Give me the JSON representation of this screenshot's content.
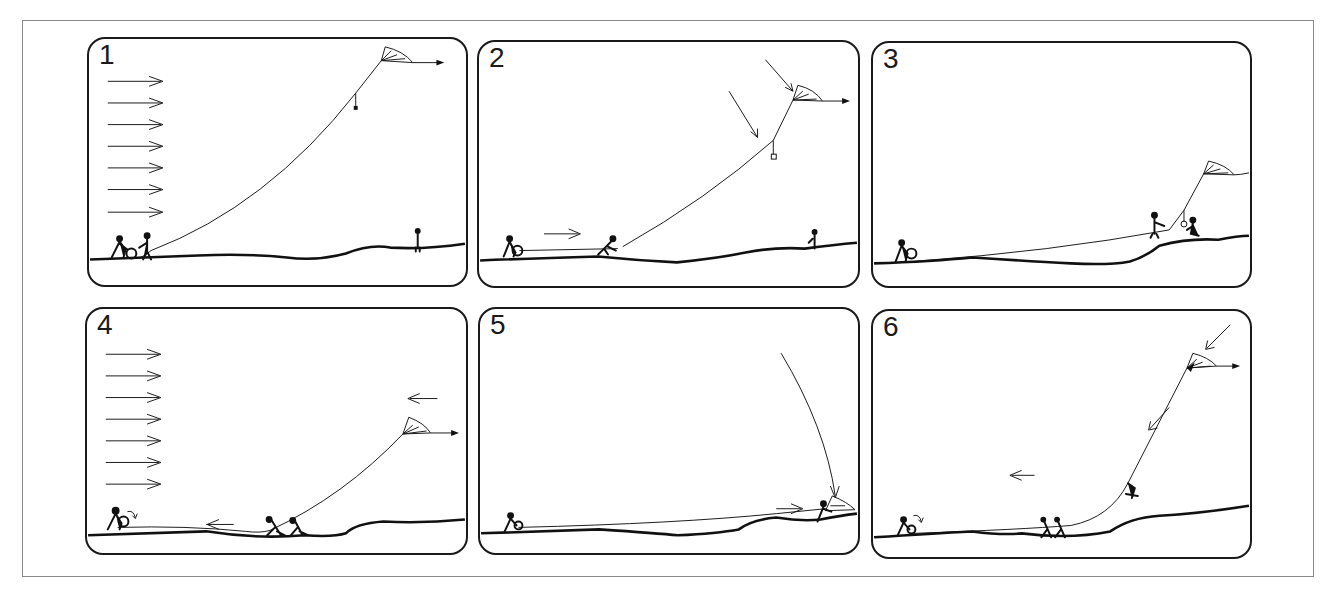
{
  "figure": {
    "type": "sequence-diagram",
    "panel_count": 6,
    "colors": {
      "ink": "#1a1a1a",
      "frame": "#8a8a8a",
      "background": "#ffffff"
    }
  },
  "panels": [
    {
      "number": "1",
      "wind_arrows": 7,
      "description": "Kite flying high; line held by two people at left; person standing on rise at right"
    },
    {
      "number": "2",
      "wind_arrows": 0,
      "description": "Kite being pulled down; arrows pointing at kite; person moving line toward right"
    },
    {
      "number": "3",
      "wind_arrows": 0,
      "description": "Kite low near ground at right; two people near the kite on the rise"
    },
    {
      "number": "4",
      "wind_arrows": 7,
      "description": "Two people hauling line leftward; kite mid-air; arrow pointing left above kite"
    },
    {
      "number": "5",
      "wind_arrows": 0,
      "description": "Kite descends along curved arrow to the ground at right; person grabbing kite"
    },
    {
      "number": "6",
      "wind_arrows": 0,
      "description": "Kite pulled down with arrows; people walking left along the line"
    }
  ]
}
